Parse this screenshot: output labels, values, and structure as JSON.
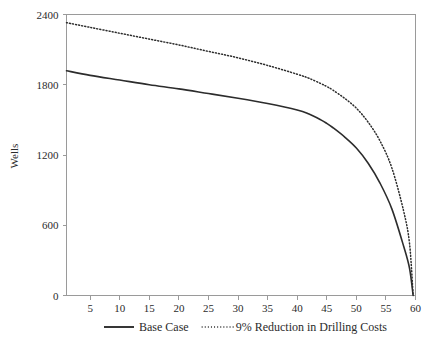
{
  "chart_data": {
    "type": "line",
    "title": "",
    "xlabel": "",
    "ylabel": "Wells",
    "xlim": [
      1,
      60
    ],
    "ylim": [
      0,
      2400
    ],
    "grid": false,
    "legend_position": "bottom",
    "x_ticks": [
      5,
      10,
      15,
      20,
      25,
      30,
      35,
      40,
      45,
      50,
      55,
      60
    ],
    "y_ticks": [
      0,
      600,
      1200,
      1800,
      2400
    ],
    "x": [
      1,
      5,
      10,
      15,
      20,
      25,
      30,
      35,
      40,
      42,
      44,
      45,
      46,
      48,
      50,
      52,
      54,
      56,
      58,
      59,
      59.6
    ],
    "series": [
      {
        "name": "Base Case",
        "style": "solid",
        "color": "#2c2c2c",
        "values": [
          1920,
          1880,
          1840,
          1800,
          1765,
          1725,
          1685,
          1640,
          1585,
          1550,
          1500,
          1470,
          1435,
          1355,
          1260,
          1130,
          960,
          740,
          420,
          230,
          0
        ]
      },
      {
        "name": "9% Reduction in Drilling Costs",
        "style": "dotted",
        "color": "#2c2c2c",
        "values": [
          2330,
          2290,
          2240,
          2190,
          2140,
          2085,
          2030,
          1965,
          1890,
          1855,
          1810,
          1785,
          1755,
          1685,
          1600,
          1480,
          1320,
          1090,
          720,
          440,
          0
        ]
      }
    ]
  },
  "legend": {
    "items": [
      {
        "label": "Base Case",
        "style": "solid"
      },
      {
        "label": "9% Reduction in Drilling Costs",
        "style": "dotted"
      }
    ]
  },
  "axes": {
    "y_title": "Wells",
    "y_tick_labels": [
      "0",
      "600",
      "1200",
      "1800",
      "2400"
    ],
    "x_tick_labels": [
      "5",
      "10",
      "15",
      "20",
      "25",
      "30",
      "35",
      "40",
      "45",
      "50",
      "55",
      "60"
    ]
  },
  "colors": {
    "series": "#2c2c2c",
    "axis": "#9a9a9a",
    "text": "#2b2b2b",
    "background": "#ffffff"
  }
}
